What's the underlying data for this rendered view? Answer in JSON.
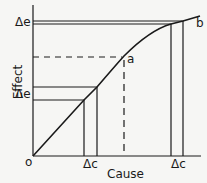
{
  "diagram": {
    "x_axis_label": "Cause",
    "y_axis_label": "Effect",
    "origin_label": "o",
    "point_a_label": "a",
    "point_b_label": "b",
    "delta_e_upper": "Δe",
    "delta_e_lower": "Δe",
    "delta_c_lower": "Δc",
    "delta_c_upper": "Δc",
    "colors": {
      "line": "#1a1a1a",
      "background": "#f6f6f4"
    }
  }
}
